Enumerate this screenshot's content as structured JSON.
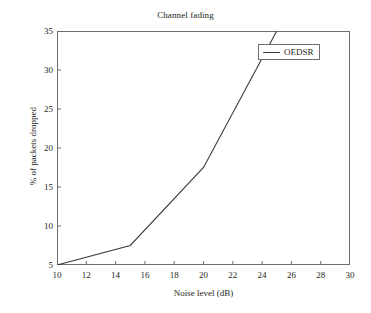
{
  "chart_data": {
    "type": "line",
    "title": "Channel fading",
    "xlabel": "Noise level (dB)",
    "ylabel": "% of packets dropped",
    "xlim": [
      10,
      30
    ],
    "ylim": [
      5,
      35
    ],
    "xticks": [
      10,
      12,
      14,
      16,
      18,
      20,
      22,
      24,
      26,
      28,
      30
    ],
    "yticks": [
      5,
      10,
      15,
      20,
      25,
      30,
      35
    ],
    "grid": false,
    "legend_position": "top-right",
    "series": [
      {
        "name": "OEDSR",
        "color": "#3a3a3a",
        "x": [
          10,
          15,
          20,
          25
        ],
        "values": [
          5,
          7.5,
          17.5,
          35
        ]
      }
    ]
  },
  "legend": {
    "entries": [
      {
        "label": "OEDSR"
      }
    ]
  },
  "axis_ticks": {
    "x": [
      "10",
      "12",
      "14",
      "16",
      "18",
      "20",
      "22",
      "24",
      "26",
      "28",
      "30"
    ],
    "y": [
      "5",
      "10",
      "15",
      "20",
      "25",
      "30",
      "35"
    ]
  },
  "colors": {
    "line": "#3a3a3a",
    "axis": "#6f6f6f",
    "text": "#231f20",
    "background": "#ffffff"
  }
}
